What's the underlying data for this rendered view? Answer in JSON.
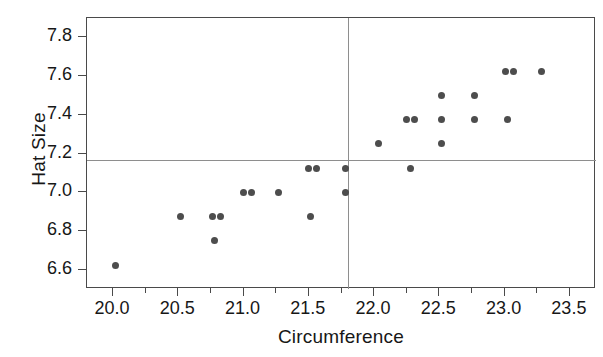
{
  "chart_data": {
    "type": "scatter",
    "title": "",
    "xlabel": "Circumference",
    "ylabel": "Hat Size",
    "xlim": [
      19.8,
      23.7
    ],
    "ylim": [
      6.5,
      7.9
    ],
    "xticks": [
      20.0,
      20.5,
      21.0,
      21.5,
      22.0,
      22.5,
      23.0,
      23.5
    ],
    "xticklabels": [
      "20.0",
      "20.5",
      "21.0",
      "21.5",
      "22.0",
      "22.5",
      "23.0",
      "23.5"
    ],
    "xminorticks": [
      20.25,
      20.75,
      21.25,
      21.75,
      22.25,
      22.75,
      23.25
    ],
    "yticks": [
      6.6,
      6.8,
      7.0,
      7.2,
      7.4,
      7.6,
      7.8
    ],
    "yticklabels": [
      "6.6",
      "6.8",
      "7.0",
      "7.2",
      "7.4",
      "7.6",
      "7.8"
    ],
    "grid": false,
    "legend": null,
    "marker_color": "#4d4d4d",
    "reference_lines": [
      {
        "orientation": "horizontal",
        "value": 7.165,
        "color": "#8e8e8e",
        "label": "mean-hat-size"
      },
      {
        "orientation": "vertical",
        "value": 21.8,
        "color": "#8e8e8e",
        "label": "mean-circumference"
      }
    ],
    "points": [
      {
        "x": 20.02,
        "y": 6.62
      },
      {
        "x": 20.52,
        "y": 6.875
      },
      {
        "x": 20.76,
        "y": 6.875
      },
      {
        "x": 20.82,
        "y": 6.875
      },
      {
        "x": 20.78,
        "y": 6.75
      },
      {
        "x": 21.0,
        "y": 7.0
      },
      {
        "x": 21.06,
        "y": 7.0
      },
      {
        "x": 21.27,
        "y": 7.0
      },
      {
        "x": 21.5,
        "y": 7.125
      },
      {
        "x": 21.56,
        "y": 7.125
      },
      {
        "x": 21.51,
        "y": 6.875
      },
      {
        "x": 21.78,
        "y": 7.125
      },
      {
        "x": 21.78,
        "y": 7.0
      },
      {
        "x": 22.03,
        "y": 7.25
      },
      {
        "x": 22.25,
        "y": 7.375
      },
      {
        "x": 22.31,
        "y": 7.375
      },
      {
        "x": 22.28,
        "y": 7.125
      },
      {
        "x": 22.52,
        "y": 7.5
      },
      {
        "x": 22.52,
        "y": 7.375
      },
      {
        "x": 22.52,
        "y": 7.25
      },
      {
        "x": 22.77,
        "y": 7.5
      },
      {
        "x": 22.77,
        "y": 7.375
      },
      {
        "x": 23.01,
        "y": 7.625
      },
      {
        "x": 23.07,
        "y": 7.625
      },
      {
        "x": 23.02,
        "y": 7.375
      },
      {
        "x": 23.28,
        "y": 7.625
      }
    ]
  }
}
